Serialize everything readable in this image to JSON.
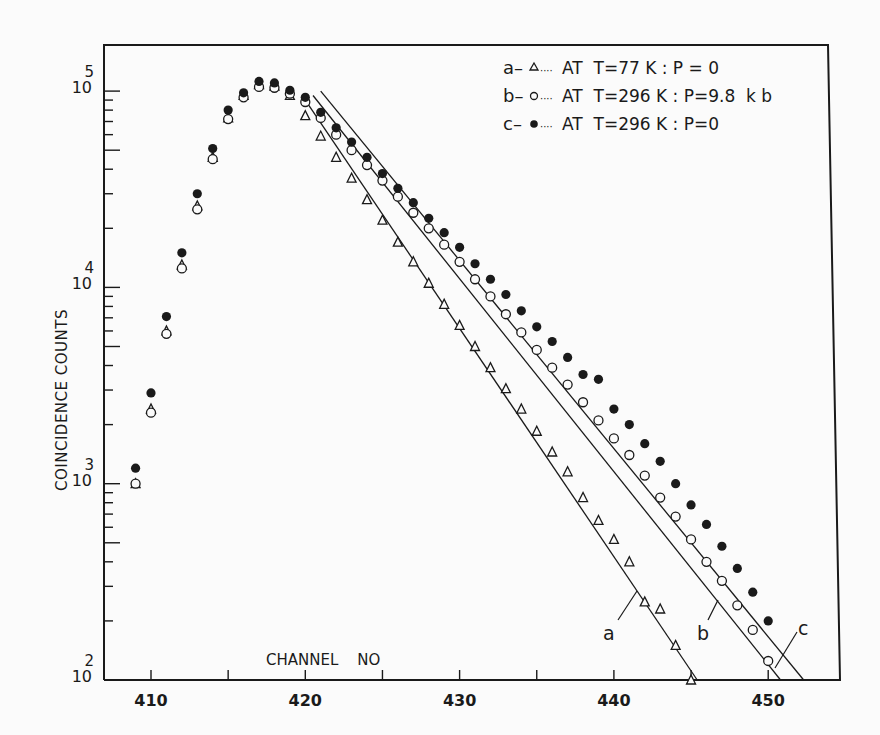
{
  "chart_data": {
    "type": "scatter",
    "title": "",
    "xlabel": "CHANNEL  NO",
    "ylabel": "COINCIDENCE   COUNTS",
    "yscale": "log",
    "xlim": [
      407.5,
      455
    ],
    "ylim": [
      100,
      150000
    ],
    "x_ticks": [
      410,
      415,
      420,
      425,
      430,
      435,
      440,
      445,
      450
    ],
    "x_tick_labels": [
      "410",
      "",
      "420",
      "",
      "430",
      "",
      "440",
      "",
      "450"
    ],
    "y_ticks": [
      100,
      1000,
      10000,
      100000
    ],
    "y_tick_labels": [
      {
        "base": "10",
        "exp": "2"
      },
      {
        "base": "10",
        "exp": "3"
      },
      {
        "base": "10",
        "exp": "4"
      },
      {
        "base": "10",
        "exp": "5"
      }
    ],
    "grid": false,
    "legend_position": "upper right",
    "series": [
      {
        "name": "a",
        "marker": "triangle-open",
        "legend": "AT  T=77 K : P = 0",
        "x": [
          409,
          410,
          411,
          412,
          413,
          414,
          415,
          416,
          417,
          418,
          419,
          420,
          421,
          422,
          423,
          424,
          425,
          426,
          427,
          428,
          429,
          430,
          431,
          432,
          433,
          434,
          435,
          436,
          437,
          438,
          439,
          440,
          441,
          442,
          443,
          444,
          445
        ],
        "values": [
          1000,
          2400,
          6000,
          13000,
          26000,
          46000,
          73000,
          95000,
          108000,
          106000,
          95000,
          75000,
          59000,
          46000,
          36000,
          28000,
          22000,
          17000,
          13500,
          10500,
          8200,
          6400,
          5000,
          3900,
          3050,
          2400,
          1850,
          1450,
          1150,
          850,
          650,
          520,
          400,
          250,
          230,
          150,
          100
        ]
      },
      {
        "name": "b",
        "marker": "circle-open",
        "legend": "AT  T=296 K : P = 9.8  k b",
        "x": [
          409,
          410,
          411,
          412,
          413,
          414,
          415,
          416,
          417,
          418,
          419,
          420,
          421,
          422,
          423,
          424,
          425,
          426,
          427,
          428,
          429,
          430,
          431,
          432,
          433,
          434,
          435,
          436,
          437,
          438,
          439,
          440,
          441,
          442,
          443,
          444,
          445,
          446,
          447,
          448,
          449,
          450
        ],
        "values": [
          1000,
          2300,
          5800,
          12500,
          25000,
          45000,
          72000,
          93000,
          105000,
          104000,
          97000,
          88000,
          73000,
          60000,
          50000,
          42000,
          35000,
          29000,
          24000,
          20000,
          16500,
          13500,
          11000,
          9000,
          7300,
          5900,
          4800,
          3900,
          3200,
          2600,
          2100,
          1700,
          1400,
          1100,
          850,
          680,
          520,
          400,
          320,
          240,
          180,
          125
        ]
      },
      {
        "name": "c",
        "marker": "circle-filled",
        "legend": "AT  T=296 K : P = 0",
        "x": [
          409,
          410,
          411,
          412,
          413,
          414,
          415,
          416,
          417,
          418,
          419,
          420,
          421,
          422,
          423,
          424,
          425,
          426,
          427,
          428,
          429,
          430,
          431,
          432,
          433,
          434,
          435,
          436,
          437,
          438,
          439,
          440,
          441,
          442,
          443,
          444,
          445,
          446,
          447,
          448,
          449,
          450
        ],
        "values": [
          1200,
          2900,
          7100,
          15000,
          30000,
          51000,
          80000,
          98000,
          112000,
          110000,
          101000,
          93000,
          78000,
          65000,
          55000,
          46000,
          38000,
          32000,
          27000,
          22500,
          19000,
          16000,
          13200,
          11000,
          9200,
          7600,
          6300,
          5300,
          4400,
          3600,
          3400,
          2400,
          2000,
          1600,
          1300,
          1000,
          780,
          620,
          480,
          370,
          280,
          200
        ]
      }
    ],
    "fit_lines": [
      {
        "name": "a",
        "x": [
          420,
          445.4
        ],
        "values": [
          90000,
          100
        ]
      },
      {
        "name": "b",
        "x": [
          420.5,
          450.8
        ],
        "values": [
          95000,
          100
        ]
      },
      {
        "name": "c",
        "x": [
          421,
          452.3
        ],
        "values": [
          100000,
          100
        ]
      }
    ],
    "annotations": [
      "a",
      "b",
      "c"
    ]
  },
  "legend": {
    "items": [
      {
        "key": "a",
        "symbol": "triangle-open",
        "text": "AT  T=77 K : P = 0"
      },
      {
        "key": "b",
        "symbol": "circle-open",
        "text": "AT  T=296 K : P=9.8  k b"
      },
      {
        "key": "c",
        "symbol": "circle-filled",
        "text": "AT  T=296 K : P=0"
      }
    ]
  },
  "axes": {
    "xlabel": "CHANNEL    NO",
    "ylabel": "COINCIDENCE    COUNTS"
  }
}
